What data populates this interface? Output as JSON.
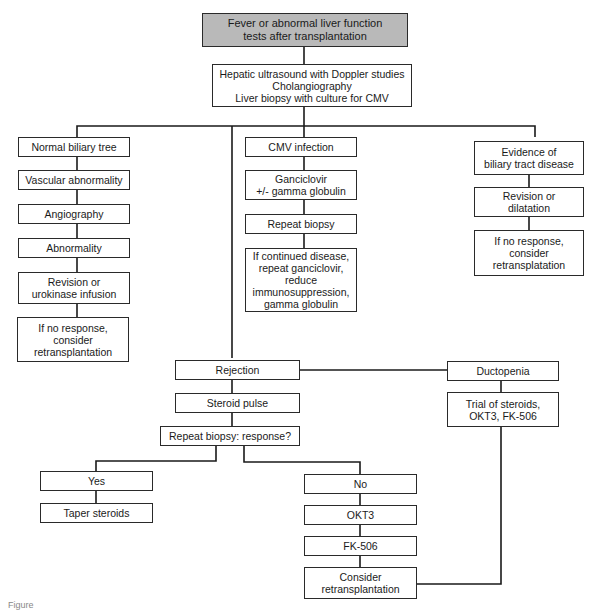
{
  "flowchart": {
    "root": "Fever or abnormal liver function\ntests after transplantation",
    "workup": "Hepatic ultrasound with Doppler studies\nCholangiography\nLiver biopsy with culture for CMV",
    "left_branch": [
      "Normal biliary tree",
      "Vascular abnormality",
      "Angiography",
      "Abnormality",
      "Revision or\nurokinase infusion",
      "If no response,\nconsider\nretransplantation"
    ],
    "cmv_branch": [
      "CMV infection",
      "Ganciclovir\n+/- gamma globulin",
      "Repeat biopsy",
      "If continued disease,\nrepeat ganciclovir,\nreduce\nimmunosuppression,\ngamma globulin"
    ],
    "biliary_branch": [
      "Evidence of\nbiliary tract disease",
      "Revision or\ndilatation",
      "If no response,\nconsider\nretransplatation"
    ],
    "rejection_branch": [
      "Rejection",
      "Steroid pulse",
      "Repeat biopsy: response?"
    ],
    "ductopenia_branch": [
      "Ductopenia",
      "Trial of steroids,\nOKT3, FK-506"
    ],
    "yes_branch": [
      "Yes",
      "Taper steroids"
    ],
    "no_branch": [
      "No",
      "OKT3",
      "FK-506",
      "Consider\nretransplantation"
    ]
  },
  "caption": "Figure"
}
